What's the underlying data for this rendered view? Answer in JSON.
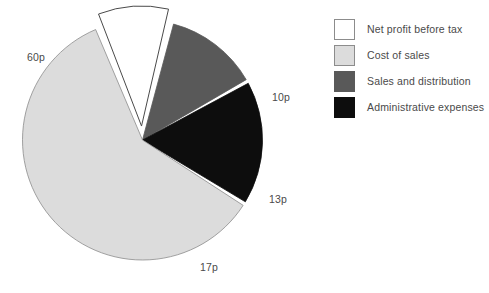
{
  "chart_data": {
    "type": "pie",
    "title": "",
    "subtitle": "",
    "xlabel": "",
    "ylabel": "",
    "unit": "p",
    "total": 100,
    "grid": false,
    "legend_position": "right",
    "exploded_slices": [
      "Net profit before tax"
    ],
    "categories": [
      "Net profit before tax",
      "Cost of sales",
      "Sales and distribution",
      "Administrative expenses"
    ],
    "values": [
      10,
      60,
      13,
      17
    ],
    "data_labels": [
      "10p",
      "60p",
      "13p",
      "17p"
    ],
    "colors": [
      "#ffffff",
      "#dcdcdc",
      "#595959",
      "#0d0d0d"
    ],
    "slices": [
      {
        "label": "Net profit before tax",
        "value": 10,
        "data_label": "10p",
        "color": "#ffffff",
        "stroke": "#4a4a4a",
        "exploded": true
      },
      {
        "label": "Cost of sales",
        "value": 60,
        "data_label": "60p",
        "color": "#dcdcdc",
        "stroke": "#8c8c8c",
        "exploded": false
      },
      {
        "label": "Sales and distribution",
        "value": 13,
        "data_label": "13p",
        "color": "#595959",
        "stroke": "#595959",
        "exploded": false
      },
      {
        "label": "Administrative expenses",
        "value": 17,
        "data_label": "17p",
        "color": "#0d0d0d",
        "stroke": "#0d0d0d",
        "exploded": false
      }
    ]
  },
  "legend": {
    "items": [
      {
        "label": "Net profit before tax",
        "swatch_color": "#ffffff",
        "swatch_border": "#8c8c8c"
      },
      {
        "label": "Cost of sales",
        "swatch_color": "#dcdcdc",
        "swatch_border": "#8c8c8c"
      },
      {
        "label": "Sales and distribution",
        "swatch_color": "#595959",
        "swatch_border": "#595959"
      },
      {
        "label": "Administrative expenses",
        "swatch_color": "#0d0d0d",
        "swatch_border": "#0d0d0d"
      }
    ]
  },
  "theme": {
    "background": "#ffffff",
    "text_color": "#4a4a4a",
    "outline_color": "#8c8c8c"
  }
}
